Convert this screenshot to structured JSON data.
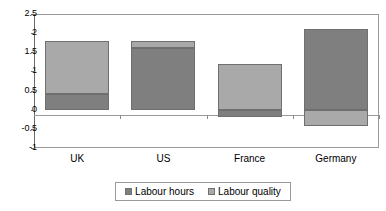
{
  "chart_data": {
    "type": "bar",
    "subtype": "stacked-bar-with-negatives",
    "title": "",
    "xlabel": "",
    "ylabel": "",
    "categories": [
      "UK",
      "US",
      "France",
      "Germany"
    ],
    "series": [
      {
        "name": "Labour hours",
        "color": "#7f7f7f",
        "values": [
          0.42,
          1.6,
          -0.2,
          2.1
        ]
      },
      {
        "name": "Labour quality",
        "color": "#a9a9a9",
        "values": [
          1.38,
          0.2,
          1.2,
          -0.42
        ]
      }
    ],
    "totals": [
      1.8,
      1.8,
      1.0,
      1.68
    ],
    "ylim": [
      -1,
      2.5
    ],
    "yticks": [
      2.5,
      2,
      1.5,
      1,
      0.5,
      0,
      -0.5,
      -1
    ],
    "ytick_labels": [
      "2.5",
      "2",
      "1.5",
      "1",
      "0.5",
      "0",
      "-0.5",
      "-1"
    ],
    "grid": false,
    "legend_position": "bottom",
    "zero_line": true
  },
  "legend": {
    "items": [
      {
        "label": "Labour hours",
        "color": "#7f7f7f"
      },
      {
        "label": "Labour quality",
        "color": "#a9a9a9"
      }
    ]
  },
  "colors": {
    "labour_hours": "#7f7f7f",
    "labour_quality": "#a9a9a9",
    "axis": "#6a6a6a",
    "frame": "#9a9a9a",
    "background": "#ffffff"
  }
}
